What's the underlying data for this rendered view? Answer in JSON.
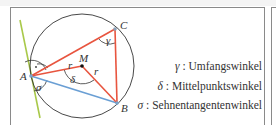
{
  "diagram": {
    "points": {
      "A": {
        "label": "A",
        "x": 31,
        "y": 76
      },
      "B": {
        "label": "B",
        "x": 117,
        "y": 103
      },
      "C": {
        "label": "C",
        "x": 115,
        "y": 29
      },
      "M": {
        "label": "M",
        "x": 82,
        "y": 66
      }
    },
    "circle": {
      "cx": 82,
      "cy": 66,
      "r": 52
    },
    "radius_label": "r",
    "angle_labels": {
      "gamma": "γ",
      "delta": "δ",
      "sigma": "σ",
      "right_angle_dot": "·"
    },
    "colors": {
      "triangle": "#e8553f",
      "chord_AB": "#6a9fd4",
      "tangent": "#a9c94a",
      "circle": "#333333",
      "frame": "#8a8a8a"
    }
  },
  "legend": [
    {
      "symbol": "γ",
      "separator": ":",
      "text": "Umfangswinkel"
    },
    {
      "symbol": "δ",
      "separator": ":",
      "text": "Mittelpunktswinkel"
    },
    {
      "symbol": "σ",
      "separator": ":",
      "text": "Sehnentangentenwinkel"
    }
  ]
}
